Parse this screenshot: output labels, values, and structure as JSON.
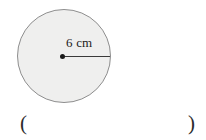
{
  "figure": {
    "type": "circle-with-radius",
    "shape_name": "circle",
    "radius_label": "6 cm",
    "radius_value": 6,
    "radius_unit": "cm",
    "fill_color": "#efefee",
    "stroke_color": "#8e8e8e",
    "line_color": "#3a3a3a",
    "center_marker": "center-point-dot"
  },
  "answer": {
    "open_paren": "(",
    "close_paren": ")",
    "value": "",
    "placeholder": ""
  }
}
